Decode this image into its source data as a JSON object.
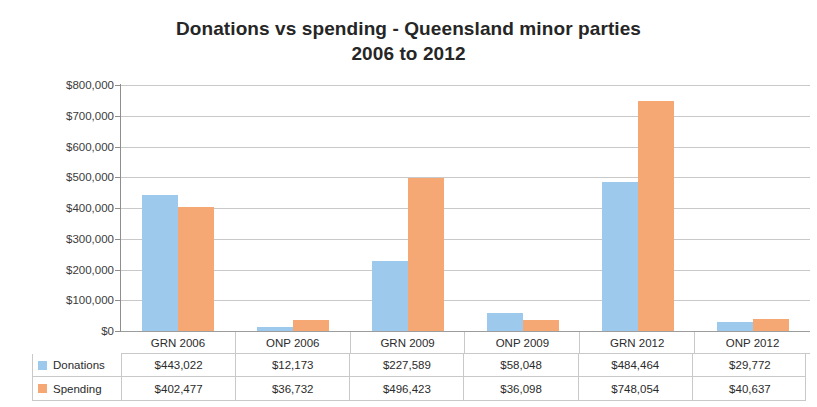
{
  "chart_data": {
    "type": "bar",
    "title": "Donations vs spending - Queensland minor parties 2006 to 2012",
    "title_line1": "Donations vs spending - Queensland minor parties",
    "title_line2": "2006 to 2012",
    "xlabel": "",
    "ylabel": "",
    "ylim": [
      0,
      800000
    ],
    "grid": true,
    "legend_position": "data-table",
    "categories": [
      "GRN 2006",
      "ONP 2006",
      "GRN 2009",
      "ONP 2009",
      "GRN 2012",
      "ONP 2012"
    ],
    "ytick_labels": [
      "$800,000",
      "$700,000",
      "$600,000",
      "$500,000",
      "$400,000",
      "$300,000",
      "$200,000",
      "$100,000",
      "$0"
    ],
    "ytick_values": [
      800000,
      700000,
      600000,
      500000,
      400000,
      300000,
      200000,
      100000,
      0
    ],
    "series": [
      {
        "name": "Donations",
        "color": "#9DC9ED",
        "values": [
          443022,
          12173,
          227589,
          58048,
          484464,
          29772
        ],
        "labels": [
          "$443,022",
          "$12,173",
          "$227,589",
          "$58,048",
          "$484,464",
          "$29,772"
        ]
      },
      {
        "name": "Spending",
        "color": "#F5A873",
        "values": [
          402477,
          36732,
          496423,
          36098,
          748054,
          40637
        ],
        "labels": [
          "$402,477",
          "$36,732",
          "$496,423",
          "$36,098",
          "$748,054",
          "$40,637"
        ]
      }
    ]
  },
  "colors": {
    "donations": "#9DC9ED",
    "spending": "#F5A873",
    "gridline": "#c9c9c9",
    "axis": "#8e8e8e",
    "text": "#2b2b2b",
    "background": "#ffffff"
  }
}
